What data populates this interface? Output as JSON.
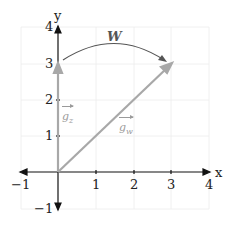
{
  "diagram": {
    "axes": {
      "x_label": "x",
      "y_label": "y",
      "x_ticks": [
        "−1",
        "1",
        "2",
        "3",
        "4"
      ],
      "y_ticks": [
        "4",
        "3",
        "2",
        "1",
        "−1"
      ],
      "x_range": [
        -1,
        4
      ],
      "y_range": [
        -1,
        4
      ]
    },
    "vectors": [
      {
        "name": "g_z",
        "label_base": "g",
        "label_sub": "z",
        "from": [
          0,
          0
        ],
        "to": [
          0,
          3
        ],
        "color": "#a8a8a8"
      },
      {
        "name": "g_w",
        "label_base": "g",
        "label_sub": "w",
        "from": [
          0,
          0
        ],
        "to": [
          3,
          3
        ],
        "color": "#a8a8a8"
      }
    ],
    "rotation": {
      "label": "W",
      "from": [
        0,
        3
      ],
      "to": [
        3,
        3
      ],
      "color": "#555555"
    },
    "colors": {
      "axis": "#111111",
      "grid": "#ececec",
      "vector": "#a8a8a8",
      "arc": "#555555"
    }
  }
}
